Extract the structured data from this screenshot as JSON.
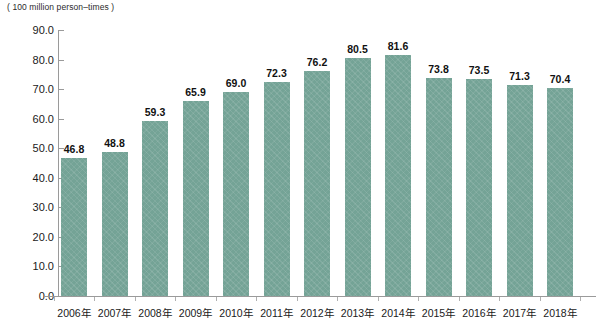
{
  "chart_data": {
    "type": "bar",
    "title": "",
    "unit_caption": "( 100 million person–times )",
    "xlabel": "",
    "ylabel": "",
    "ylim": [
      0.0,
      90.0
    ],
    "y_ticks": [
      "0.0",
      "10.0",
      "20.0",
      "30.0",
      "40.0",
      "50.0",
      "60.0",
      "70.0",
      "80.0",
      "90.0"
    ],
    "grid": false,
    "legend": "none",
    "bar_color": "#74a396",
    "label_color": "#111111",
    "axis_color": "#9a9a9a",
    "categories": [
      "2006年",
      "2007年",
      "2008年",
      "2009年",
      "2010年",
      "2011年",
      "2012年",
      "2013年",
      "2014年",
      "2015年",
      "2016年",
      "2017年",
      "2018年"
    ],
    "values": [
      46.8,
      48.8,
      59.3,
      65.9,
      69.0,
      72.3,
      76.2,
      80.5,
      81.6,
      73.8,
      73.5,
      71.3,
      70.4
    ],
    "data_labels": [
      "46.8",
      "48.8",
      "59.3",
      "65.9",
      "69.0",
      "72.3",
      "76.2",
      "80.5",
      "81.6",
      "73.8",
      "73.5",
      "71.3",
      "70.4"
    ]
  }
}
